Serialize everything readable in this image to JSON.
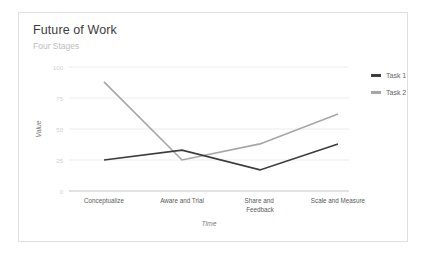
{
  "card": {
    "title": "Future of Work",
    "subtitle": "Four Stages"
  },
  "legend": {
    "items": [
      {
        "label": "Task 1",
        "color": "#3c3c3c"
      },
      {
        "label": "Task 2",
        "color": "#a6a6a6"
      }
    ]
  },
  "colors": {
    "task1": "#3c3c3c",
    "task2": "#a6a6a6",
    "grid": "#ececec",
    "axis": "#d8d8d8",
    "border": "#e0e0e0",
    "title": "#3c3c3c",
    "subtitle": "#bdbdbd"
  },
  "chart_data": {
    "type": "line",
    "title": "Future of Work",
    "subtitle": "Four Stages",
    "xlabel": "Time",
    "ylabel": "Value",
    "categories": [
      "Conceptualize",
      "Aware and Trial",
      "Share and Feedback",
      "Scale and Measure"
    ],
    "series": [
      {
        "name": "Task 1",
        "values": [
          25,
          33,
          17,
          38
        ],
        "color": "#3c3c3c"
      },
      {
        "name": "Task 2",
        "values": [
          88,
          25,
          38,
          62
        ],
        "color": "#a6a6a6"
      }
    ],
    "ylim": [
      0,
      100
    ],
    "yticks": [
      0,
      25,
      50,
      75,
      100
    ],
    "ytick_labels": [
      "0",
      "25",
      "50",
      "75",
      "100"
    ],
    "grid": true,
    "legend_position": "right"
  }
}
